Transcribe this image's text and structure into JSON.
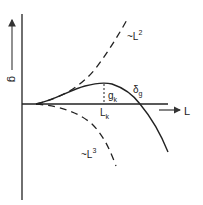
{
  "diagram": {
    "axes": {
      "y_label": "g",
      "x_label": "L"
    },
    "curves": {
      "upper_dashed": {
        "label_prefix": "~L",
        "exponent": "2"
      },
      "lower_dashed": {
        "label_prefix": "~L",
        "exponent": "3"
      },
      "solid": {
        "label_base": "δ",
        "label_sub": "g"
      }
    },
    "peak": {
      "g_label_base": "g",
      "g_label_sub": "k",
      "l_label_base": "L",
      "l_label_sub": "k"
    },
    "colors": {
      "line": "#222222",
      "arrow": "#555555",
      "background": "#ffffff"
    }
  }
}
